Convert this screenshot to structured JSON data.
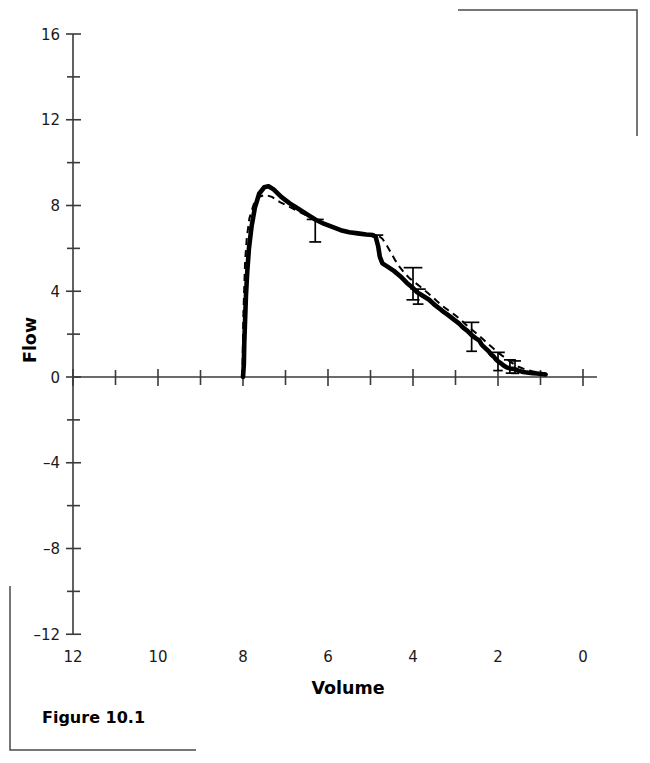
{
  "figure": {
    "caption": "Figure 10.1"
  },
  "chart_data": {
    "type": "line",
    "title": "",
    "xlabel": "Volume",
    "ylabel": "Flow",
    "xlim": [
      12,
      0
    ],
    "ylim": [
      -12,
      16
    ],
    "x_axis_reversed": true,
    "grid": false,
    "legend": "none",
    "x_ticks": [
      12,
      10,
      8,
      6,
      4,
      2,
      0
    ],
    "x_tick_labels": [
      "12",
      "10",
      "8",
      "6",
      "4",
      "2",
      "0"
    ],
    "x_minor_ticks": [
      11,
      9,
      7,
      5,
      3,
      1
    ],
    "y_ticks": [
      16,
      12,
      8,
      4,
      0,
      -4,
      -8,
      -12
    ],
    "y_tick_labels": [
      "16",
      "12",
      "8",
      "4",
      "0",
      "–4",
      "–8",
      "–12"
    ],
    "y_minor_ticks": [
      14,
      10,
      6,
      2,
      -2,
      -6,
      -10
    ],
    "series": [
      {
        "name": "solid",
        "style": "solid",
        "points": [
          [
            8.0,
            0.0
          ],
          [
            7.98,
            0.6
          ],
          [
            7.97,
            1.6
          ],
          [
            7.95,
            2.7
          ],
          [
            7.93,
            3.8
          ],
          [
            7.9,
            4.9
          ],
          [
            7.86,
            6.0
          ],
          [
            7.8,
            7.0
          ],
          [
            7.72,
            7.9
          ],
          [
            7.62,
            8.55
          ],
          [
            7.5,
            8.85
          ],
          [
            7.4,
            8.9
          ],
          [
            7.28,
            8.75
          ],
          [
            7.1,
            8.4
          ],
          [
            6.9,
            8.1
          ],
          [
            6.7,
            7.85
          ],
          [
            6.5,
            7.6
          ],
          [
            6.3,
            7.35
          ],
          [
            6.1,
            7.15
          ],
          [
            5.9,
            7.0
          ],
          [
            5.7,
            6.85
          ],
          [
            5.5,
            6.75
          ],
          [
            5.3,
            6.7
          ],
          [
            5.1,
            6.65
          ],
          [
            4.95,
            6.62
          ],
          [
            4.88,
            6.55
          ],
          [
            4.82,
            6.1
          ],
          [
            4.78,
            5.6
          ],
          [
            4.72,
            5.3
          ],
          [
            4.6,
            5.15
          ],
          [
            4.45,
            4.95
          ],
          [
            4.3,
            4.7
          ],
          [
            4.15,
            4.4
          ],
          [
            4.0,
            4.15
          ],
          [
            3.9,
            3.95
          ],
          [
            3.78,
            3.8
          ],
          [
            3.62,
            3.6
          ],
          [
            3.48,
            3.35
          ],
          [
            3.32,
            3.1
          ],
          [
            3.18,
            2.9
          ],
          [
            3.05,
            2.7
          ],
          [
            2.92,
            2.5
          ],
          [
            2.82,
            2.3
          ],
          [
            2.72,
            2.15
          ],
          [
            2.62,
            1.95
          ],
          [
            2.52,
            1.8
          ],
          [
            2.44,
            1.7
          ],
          [
            2.38,
            1.5
          ],
          [
            2.3,
            1.35
          ],
          [
            2.22,
            1.2
          ],
          [
            2.16,
            1.05
          ],
          [
            2.1,
            0.95
          ],
          [
            2.04,
            0.8
          ],
          [
            1.98,
            0.7
          ],
          [
            1.92,
            0.62
          ],
          [
            1.86,
            0.52
          ],
          [
            1.8,
            0.45
          ],
          [
            1.72,
            0.4
          ],
          [
            1.62,
            0.38
          ],
          [
            1.52,
            0.3
          ],
          [
            1.44,
            0.25
          ],
          [
            1.36,
            0.22
          ],
          [
            1.28,
            0.2
          ],
          [
            1.18,
            0.18
          ],
          [
            1.08,
            0.16
          ],
          [
            0.98,
            0.14
          ],
          [
            0.88,
            0.12
          ]
        ]
      },
      {
        "name": "dashed",
        "style": "dashed",
        "points": [
          [
            8.02,
            0.0
          ],
          [
            8.01,
            0.7
          ],
          [
            8.0,
            1.8
          ],
          [
            7.99,
            3.0
          ],
          [
            7.97,
            4.2
          ],
          [
            7.95,
            5.4
          ],
          [
            7.91,
            6.5
          ],
          [
            7.85,
            7.4
          ],
          [
            7.75,
            8.05
          ],
          [
            7.62,
            8.4
          ],
          [
            7.48,
            8.5
          ],
          [
            7.32,
            8.4
          ],
          [
            7.12,
            8.15
          ],
          [
            6.92,
            7.95
          ],
          [
            6.72,
            7.75
          ],
          [
            6.52,
            7.55
          ],
          [
            6.32,
            7.35
          ],
          [
            6.12,
            7.15
          ],
          [
            5.92,
            7.0
          ],
          [
            5.72,
            6.88
          ],
          [
            5.52,
            6.78
          ],
          [
            5.32,
            6.72
          ],
          [
            5.12,
            6.68
          ],
          [
            4.95,
            6.65
          ],
          [
            4.82,
            6.6
          ],
          [
            4.72,
            6.45
          ],
          [
            4.62,
            6.15
          ],
          [
            4.52,
            5.8
          ],
          [
            4.42,
            5.45
          ],
          [
            4.32,
            5.15
          ],
          [
            4.2,
            4.85
          ],
          [
            4.08,
            4.6
          ],
          [
            3.95,
            4.4
          ],
          [
            3.82,
            4.2
          ],
          [
            3.7,
            4.0
          ],
          [
            3.58,
            3.8
          ],
          [
            3.44,
            3.55
          ],
          [
            3.3,
            3.3
          ],
          [
            3.16,
            3.1
          ],
          [
            3.02,
            2.9
          ],
          [
            2.88,
            2.68
          ],
          [
            2.76,
            2.45
          ],
          [
            2.64,
            2.25
          ],
          [
            2.52,
            2.05
          ],
          [
            2.42,
            1.88
          ],
          [
            2.32,
            1.7
          ],
          [
            2.22,
            1.52
          ],
          [
            2.12,
            1.35
          ],
          [
            2.02,
            1.18
          ],
          [
            1.92,
            1.02
          ],
          [
            1.82,
            0.88
          ],
          [
            1.72,
            0.72
          ],
          [
            1.62,
            0.6
          ],
          [
            1.52,
            0.48
          ],
          [
            1.42,
            0.4
          ],
          [
            1.3,
            0.32
          ],
          [
            1.18,
            0.26
          ],
          [
            1.06,
            0.22
          ],
          [
            0.94,
            0.18
          ],
          [
            0.86,
            0.15
          ]
        ]
      }
    ],
    "error_bars": [
      {
        "x": 6.3,
        "y": 7.35,
        "lower": 1.05,
        "upper": 0.0,
        "cap": 0.2
      },
      {
        "x": 4.92,
        "y": 6.62,
        "lower": 0.0,
        "upper": 0.0,
        "cap": 0.22
      },
      {
        "x": 4.0,
        "y": 4.55,
        "lower": 0.95,
        "upper": 0.55,
        "cap": 0.22
      },
      {
        "x": 3.88,
        "y": 4.1,
        "lower": 0.7,
        "upper": 0.0,
        "cap": 0.18
      },
      {
        "x": 2.62,
        "y": 2.15,
        "lower": 0.95,
        "upper": 0.4,
        "cap": 0.18
      },
      {
        "x": 2.0,
        "y": 0.85,
        "lower": 0.55,
        "upper": 0.3,
        "cap": 0.16
      },
      {
        "x": 1.72,
        "y": 0.48,
        "lower": 0.3,
        "upper": 0.32,
        "cap": 0.14
      },
      {
        "x": 1.6,
        "y": 0.45,
        "lower": 0.28,
        "upper": 0.3,
        "cap": 0.14
      }
    ]
  }
}
